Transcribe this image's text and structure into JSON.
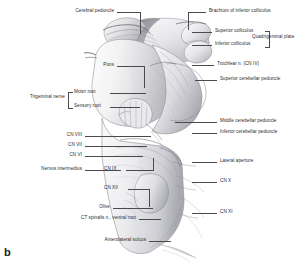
{
  "figure": {
    "panel_letter": "b",
    "ink_color": "#2b2b2b",
    "leader_color": "#4a4a4a",
    "background": "#ffffff"
  },
  "labels": {
    "cerebral_peduncle": "Cerebral peduncle",
    "brachium_inferior_colliculus": "Brachium of inferior colliculus",
    "superior_colliculus": "Superior colliculus",
    "inferior_colliculus": "Inferior colliculus",
    "quadrigeminal_plate": "Quadrigeminal plate",
    "trochlear_nerve": "Trochlear n. (CN IV)",
    "superior_cerebellar_peduncle": "Superior cerebellar peduncle",
    "pons": "Pons",
    "trigeminal_nerve": "Trigeminal nerve",
    "motor_root": "Motor root",
    "sensory_root": "Sensory root",
    "middle_cerebellar_peduncle": "Middle cerebellar peduncle",
    "inferior_cerebellar_peduncle": "Inferior cerebellar peduncle",
    "cn_viii": "CN VIII",
    "cn_vii": "CN VII",
    "cn_vi": "CN VI",
    "nervus_intermedius": "Nervus intermedius",
    "cn_ix": "CN IX",
    "cn_xii": "CN XII",
    "lateral_aperture": "Lateral aperture",
    "cn_x": "CN X",
    "cn_xi": "CN XI",
    "olive": "Olive",
    "ct_spinalis_ventral_root": "CT spinalis n., ventral root",
    "anterolateral_sulcus": "Anterolateral sulcus"
  }
}
